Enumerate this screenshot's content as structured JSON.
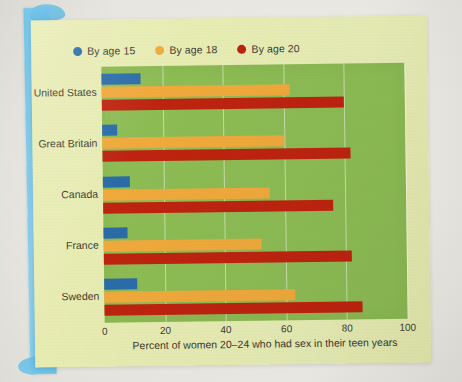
{
  "media": {
    "kind": "photographed-textbook-page",
    "tape_color": "#6dc2e9",
    "card_color": "#e8ecb4",
    "page_color": "#eeece5"
  },
  "chart_data": {
    "type": "bar",
    "orientation": "horizontal",
    "title": "",
    "xlabel": "Percent of women 20–24 who had sex in their teen years",
    "ylabel": "",
    "categories": [
      "United States",
      "Great Britain",
      "Canada",
      "France",
      "Sweden"
    ],
    "series": [
      {
        "name": "By age 15",
        "color": "#2b6ca8",
        "values": [
          13,
          5,
          9,
          8,
          11
        ]
      },
      {
        "name": "By age 18",
        "color": "#f0a93c",
        "values": [
          62,
          60,
          55,
          52,
          63
        ]
      },
      {
        "name": "By age 20",
        "color": "#be2410",
        "values": [
          80,
          82,
          76,
          82,
          85
        ]
      }
    ],
    "xlim": [
      0,
      100
    ],
    "xticks": [
      0,
      20,
      40,
      60,
      80,
      100
    ],
    "xtick_labels": [
      "0",
      "20",
      "40",
      "60",
      "80",
      "100"
    ],
    "grid": "vertical-only",
    "gridline_color": "#ffffff",
    "plot_background": "#8dbc54",
    "legend": {
      "position": "top-left",
      "entries": [
        {
          "label": "By age 15",
          "color": "#2b6ca8",
          "marker": "circle"
        },
        {
          "label": "By age 18",
          "color": "#f0a93c",
          "marker": "circle"
        },
        {
          "label": "By age 20",
          "color": "#be2410",
          "marker": "circle"
        }
      ]
    }
  }
}
